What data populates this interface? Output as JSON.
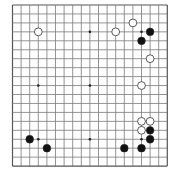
{
  "board": {
    "size": 19,
    "origin_x": 12.5,
    "origin_y": 5,
    "step_x": 8.6,
    "step_y": 8.95,
    "line_color": "#7a7a7a",
    "border_color": "#555555",
    "background": "#ffffff",
    "star_points": [
      [
        4,
        4
      ],
      [
        4,
        10
      ],
      [
        4,
        16
      ],
      [
        10,
        4
      ],
      [
        10,
        10
      ],
      [
        10,
        16
      ],
      [
        16,
        4
      ],
      [
        16,
        10
      ],
      [
        16,
        16
      ]
    ],
    "stones": [
      {
        "color": "white",
        "col": 4,
        "row": 4
      },
      {
        "color": "white",
        "col": 13,
        "row": 4
      },
      {
        "color": "white",
        "col": 15,
        "row": 3
      },
      {
        "color": "black",
        "col": 17,
        "row": 4
      },
      {
        "color": "black",
        "col": 16,
        "row": 5
      },
      {
        "color": "white",
        "col": 17,
        "row": 7
      },
      {
        "color": "white",
        "col": 16,
        "row": 10
      },
      {
        "color": "white",
        "col": 16,
        "row": 14
      },
      {
        "color": "white",
        "col": 17,
        "row": 14
      },
      {
        "color": "white",
        "col": 16,
        "row": 15
      },
      {
        "color": "black",
        "col": 17,
        "row": 15
      },
      {
        "color": "black",
        "col": 17,
        "row": 16
      },
      {
        "color": "black",
        "col": 16,
        "row": 17
      },
      {
        "color": "black",
        "col": 14,
        "row": 17
      },
      {
        "color": "black",
        "col": 3,
        "row": 16
      },
      {
        "color": "black",
        "col": 5,
        "row": 17
      }
    ],
    "stone_colors": {
      "black": "#111111",
      "white": "#ffffff",
      "outline": "#333333"
    }
  }
}
